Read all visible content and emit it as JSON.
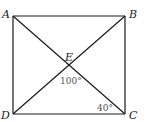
{
  "diagram": {
    "type": "geometry",
    "shape": "rectangle with diagonals",
    "points": {
      "A": {
        "label": "A",
        "x": 13,
        "y": 16
      },
      "B": {
        "label": "B",
        "x": 125,
        "y": 16
      },
      "C": {
        "label": "C",
        "x": 125,
        "y": 114
      },
      "D": {
        "label": "D",
        "x": 13,
        "y": 114
      },
      "E": {
        "label": "E",
        "x": 69,
        "y": 65
      }
    },
    "segments": [
      "AB",
      "BC",
      "CD",
      "DA",
      "AC",
      "BD"
    ],
    "angles": [
      {
        "label": "100°",
        "at": "E",
        "between": "DE, EC"
      },
      {
        "label": "40°",
        "at": "C",
        "between": "EC, CD"
      }
    ]
  }
}
